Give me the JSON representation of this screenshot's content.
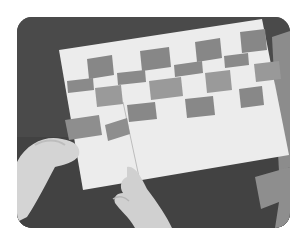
{
  "photo": {
    "subject": "hands weaving paper strips through a slit white sheet",
    "style": "grayscale",
    "colors": {
      "background_table": "#4a4a4a",
      "paper_sheet": "#ececec",
      "woven_strip": "#8a8a8a",
      "woven_strip_light": "#9c9c9c",
      "loose_strip": "#909090",
      "skin": "#d8d8d8",
      "page_background": "#ffffff"
    },
    "corner_radius": 15
  }
}
